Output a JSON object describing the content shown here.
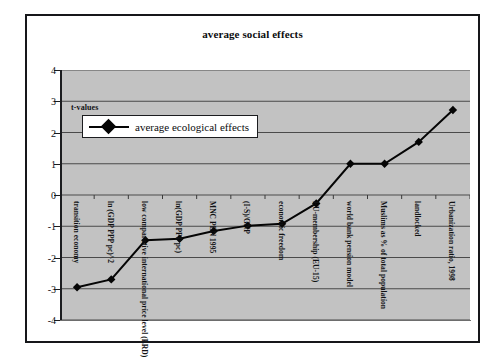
{
  "chart_data": {
    "type": "line",
    "title": "average social effects",
    "xlabel": "",
    "ylabel": "t-values",
    "ylim": [
      -4,
      4
    ],
    "yticks": [
      4,
      3,
      2,
      1,
      0,
      -1,
      -2,
      -3,
      -4
    ],
    "grid": true,
    "legend_position": "top-left-inside",
    "annotation": "t-values",
    "categories": [
      "transition economy",
      "ln (GDP PPP pc)^2",
      "low comparative international price level (ERD)",
      "ln(GDP PPP pc)",
      "MNC PEN 1995",
      "(I-S)/GNP",
      "economic freedom",
      "EU-membership (EU-15)",
      "world bank pension model",
      "Muslims as % of total population",
      "landlocked",
      "Urbanization ratio, 1998"
    ],
    "series": [
      {
        "name": "average ecological effects",
        "color": "#050505",
        "marker": "diamond",
        "values": [
          -2.95,
          -2.7,
          -1.45,
          -1.4,
          -1.15,
          -0.98,
          -0.92,
          -0.27,
          1.0,
          1.0,
          1.7,
          2.72
        ]
      }
    ]
  },
  "figure": {
    "title": "average social effects",
    "plot_background": "#c2c2c2",
    "frame_color": "#16171a",
    "annotation": "t-values"
  },
  "legend": {
    "entries": [
      {
        "label": "average ecological effects",
        "marker": "diamond-marker"
      }
    ]
  },
  "axis": {
    "y_tick_labels": [
      "4",
      "3",
      "2",
      "1",
      "0",
      "-1",
      "-2",
      "-3",
      "-4"
    ]
  }
}
